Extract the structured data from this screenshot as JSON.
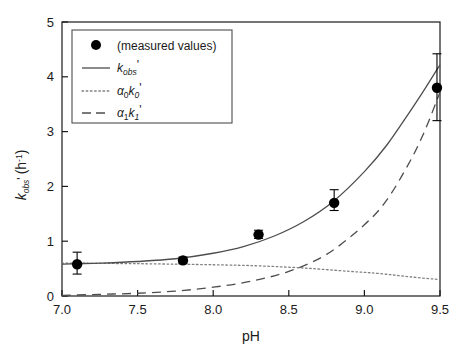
{
  "chart_data": {
    "type": "scatter",
    "title": "",
    "xlabel": "pH",
    "ylabel": "k_obs' (h^-1)",
    "ylabel_parts": {
      "symbol": "k",
      "subscript": "obs",
      "prime": "'",
      "units": "(h",
      "units_exp": "-1",
      "units_close": ")"
    },
    "xlim": [
      7.0,
      9.5
    ],
    "ylim": [
      0,
      5
    ],
    "xticks": [
      "7.0",
      "7.5",
      "8.0",
      "8.5",
      "9.0",
      "9.5"
    ],
    "xtick_values": [
      7.0,
      7.5,
      8.0,
      8.5,
      9.0,
      9.5
    ],
    "yticks": [
      "0",
      "1",
      "2",
      "3",
      "4",
      "5"
    ],
    "ytick_values": [
      0,
      1,
      2,
      3,
      4,
      5
    ],
    "grid": false,
    "legend_position": "top-left",
    "series": [
      {
        "name": "(measured values)",
        "style": "marker",
        "marker": "filled-circle",
        "color": "#000000",
        "x": [
          7.1,
          7.8,
          8.3,
          8.8,
          9.48
        ],
        "y": [
          0.58,
          0.65,
          1.12,
          1.7,
          3.8
        ],
        "yerr_low": [
          0.18,
          0.06,
          0.07,
          0.14,
          0.6
        ],
        "yerr_high": [
          0.22,
          0.06,
          0.08,
          0.24,
          0.62
        ]
      },
      {
        "name": "k_obs'",
        "style": "solid",
        "color": "#4d4d4d",
        "x": [
          7.0,
          7.1,
          7.25,
          7.5,
          7.75,
          8.0,
          8.2,
          8.4,
          8.6,
          8.8,
          9.0,
          9.15,
          9.3,
          9.4,
          9.5
        ],
        "y": [
          0.58,
          0.59,
          0.6,
          0.63,
          0.68,
          0.78,
          0.9,
          1.09,
          1.36,
          1.74,
          2.27,
          2.76,
          3.36,
          3.78,
          4.22
        ]
      },
      {
        "name": "a0k0'",
        "style": "dotted",
        "color": "#808080",
        "x": [
          7.0,
          7.5,
          8.0,
          8.3,
          8.6,
          8.9,
          9.1,
          9.3,
          9.5
        ],
        "y": [
          0.6,
          0.59,
          0.57,
          0.55,
          0.51,
          0.45,
          0.41,
          0.35,
          0.3
        ]
      },
      {
        "name": "a1k1'",
        "style": "dashed",
        "color": "#4d4d4d",
        "x": [
          7.0,
          7.25,
          7.5,
          7.75,
          8.0,
          8.25,
          8.5,
          8.75,
          9.0,
          9.15,
          9.3,
          9.4,
          9.5
        ],
        "y": [
          0.01,
          0.03,
          0.05,
          0.09,
          0.16,
          0.27,
          0.45,
          0.76,
          1.3,
          1.76,
          2.45,
          3.02,
          3.72
        ]
      }
    ]
  },
  "legend": {
    "entries": [
      {
        "label": "(measured values)",
        "swatch": "marker"
      },
      {
        "label_symbol": "k",
        "label_sub": "obs",
        "label_prime": "'",
        "swatch": "solid"
      },
      {
        "label_alpha": "α",
        "label_alpha_sub": "0",
        "label_symbol": "k",
        "label_sub": "0",
        "label_prime": "'",
        "swatch": "dotted"
      },
      {
        "label_alpha": "α",
        "label_alpha_sub": "1",
        "label_symbol": "k",
        "label_sub": "1",
        "label_prime": "'",
        "swatch": "dashed"
      }
    ]
  },
  "colors": {
    "axis": "#1a1a1a",
    "marker": "#000000",
    "solid_line": "#4d4d4d",
    "dotted_line": "#808080",
    "dashed_line": "#4d4d4d",
    "legend_border": "#4d4d4d",
    "background": "#ffffff"
  }
}
